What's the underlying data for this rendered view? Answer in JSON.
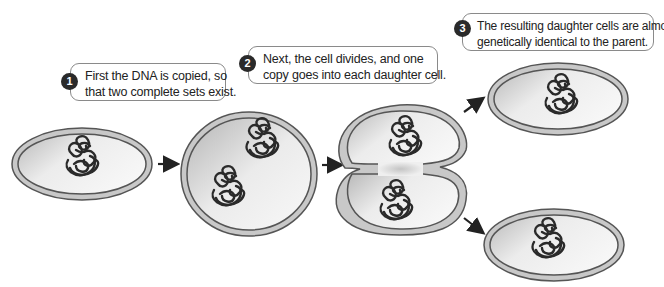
{
  "diagram": {
    "steps": [
      {
        "number": "1",
        "lines": [
          "First the DNA is copied, so",
          "that two complete sets exist."
        ]
      },
      {
        "number": "2",
        "lines": [
          "Next, the cell divides, and one",
          "copy goes into each daughter cell."
        ]
      },
      {
        "number": "3",
        "lines": [
          "The resulting daughter cells are almost",
          "genetically identical to the parent."
        ]
      }
    ],
    "stages": [
      {
        "name": "parent-cell",
        "dna_copies": 1
      },
      {
        "name": "replicated-cell",
        "dna_copies": 2
      },
      {
        "name": "dividing-cell",
        "dna_copies": 2
      },
      {
        "name": "daughter-cell-top",
        "dna_copies": 1
      },
      {
        "name": "daughter-cell-bottom",
        "dna_copies": 1
      }
    ],
    "colors": {
      "cell_wall_outer": "#555555",
      "cell_wall_fill": "#c8c8c8",
      "cytoplasm_light": "#f4f4f4",
      "cytoplasm_dark": "#bdbdbd",
      "dna": "#2a2a2a",
      "badge": "#2a2a2a",
      "arrow": "#222222"
    }
  }
}
